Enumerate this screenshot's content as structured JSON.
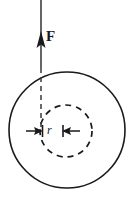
{
  "figure": {
    "type": "physics-diagram",
    "background_color": "#ffffff",
    "stroke_color": "#1a1a1a",
    "width": 138,
    "height": 204,
    "labels": {
      "force": "F",
      "radius": "r"
    },
    "outer_circle": {
      "name": "solid-circle",
      "cx": 67,
      "cy": 130,
      "r": 58,
      "style": "solid",
      "stroke_width": 1.6
    },
    "inner_circle": {
      "name": "dashed-circle",
      "cx": 66,
      "cy": 131,
      "r": 26,
      "style": "dashed",
      "stroke_width": 1.6,
      "dash_pattern": "6 5"
    },
    "force_vector": {
      "name": "force-arrow",
      "x": 41,
      "y_top": 0,
      "y_tip": 32,
      "y_bottom": 131,
      "direction": "up",
      "solid_until_y": 68,
      "dashed_from_y": 68,
      "arrow_width": 8,
      "arrow_height": 16
    },
    "radius_dimension": {
      "name": "radius-dimension",
      "y": 131,
      "left_arrow": {
        "from_x": 26,
        "to_x": 42,
        "points": "right"
      },
      "right_arrow": {
        "from_x": 80,
        "to_x": 63,
        "points": "left"
      }
    }
  }
}
